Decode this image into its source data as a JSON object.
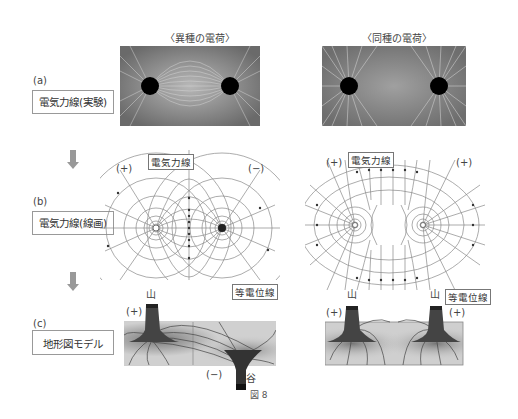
{
  "columns": {
    "opposite": "〈異種の電荷〉",
    "same": "〈同種の電荷〉"
  },
  "rows": [
    {
      "id": "a",
      "marker": "(a)",
      "label": "電気力線(実験)"
    },
    {
      "id": "b",
      "marker": "(b)",
      "label": "電気力線(線画)"
    },
    {
      "id": "c",
      "marker": "(c)",
      "label": "地形図モデル"
    }
  ],
  "row_b": {
    "left": {
      "plus": "(+)",
      "minus": "(−)",
      "field_line_callout": "電気力線",
      "equipotential_callout": "等電位線"
    },
    "right": {
      "plus_left": "(+)",
      "plus_right": "(+)",
      "field_line_callout": "電気力線",
      "equipotential_callout": "等電位線"
    }
  },
  "row_c": {
    "left": {
      "plus": "(+)",
      "minus": "(−)",
      "mountain": "山",
      "valley": "谷"
    },
    "right": {
      "plus_left": "(+)",
      "plus_right": "(+)",
      "mountain_left": "山",
      "mountain_right": "山"
    }
  },
  "figure_number": "図 8",
  "colors": {
    "arrow": "#999999",
    "line": "#888888",
    "photo_bg": "#8a8a8a"
  }
}
